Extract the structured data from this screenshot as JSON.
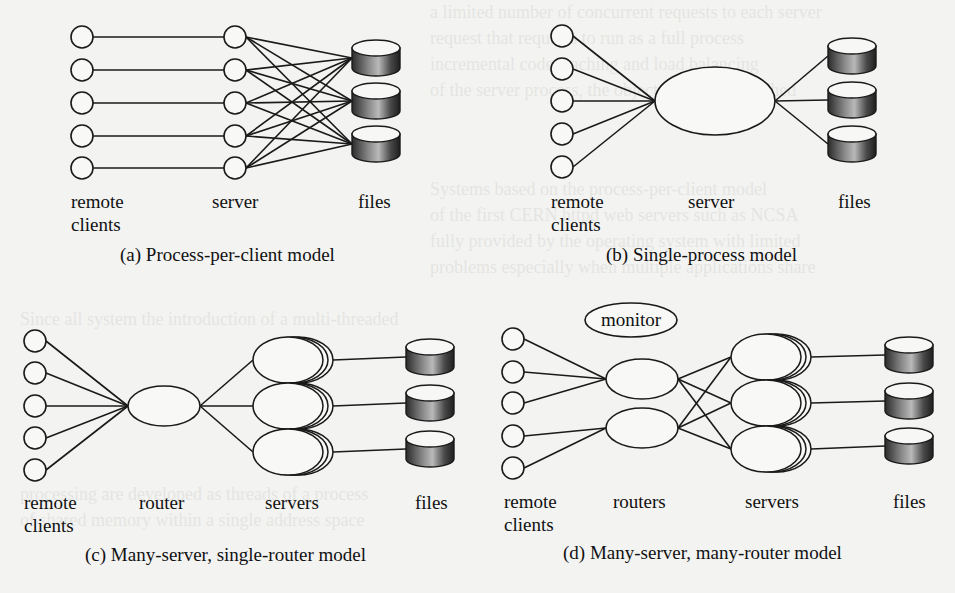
{
  "figure": {
    "panels": [
      {
        "id": "a",
        "caption": "(a) Process-per-client model",
        "labels": {
          "clients_line1": "remote",
          "clients_line2": "clients",
          "server": "server",
          "files": "files"
        },
        "clients": [
          {
            "x": 82,
            "y": 37
          },
          {
            "x": 82,
            "y": 70
          },
          {
            "x": 82,
            "y": 103
          },
          {
            "x": 82,
            "y": 136
          },
          {
            "x": 82,
            "y": 168
          }
        ],
        "servers": [
          {
            "x": 235,
            "y": 37
          },
          {
            "x": 235,
            "y": 70
          },
          {
            "x": 235,
            "y": 103
          },
          {
            "x": 235,
            "y": 136
          },
          {
            "x": 235,
            "y": 168
          }
        ],
        "files": [
          {
            "x": 352,
            "y": 40
          },
          {
            "x": 352,
            "y": 83
          },
          {
            "x": 352,
            "y": 126
          }
        ]
      },
      {
        "id": "b",
        "caption": "(b) Single-process model",
        "labels": {
          "clients_line1": "remote",
          "clients_line2": "clients",
          "server": "server",
          "files": "files"
        },
        "clients": [
          {
            "x": 562,
            "y": 36
          },
          {
            "x": 562,
            "y": 69
          },
          {
            "x": 562,
            "y": 101
          },
          {
            "x": 562,
            "y": 134
          },
          {
            "x": 562,
            "y": 167
          }
        ],
        "server": {
          "cx": 715,
          "cy": 101,
          "rx": 60,
          "ry": 34
        },
        "files": [
          {
            "x": 828,
            "y": 38
          },
          {
            "x": 828,
            "y": 82
          },
          {
            "x": 828,
            "y": 126
          }
        ]
      },
      {
        "id": "c",
        "caption": "(c) Many-server, single-router model",
        "labels": {
          "clients_line1": "remote",
          "clients_line2": "clients",
          "router": "router",
          "servers": "servers",
          "files": "files"
        },
        "clients": [
          {
            "x": 35,
            "y": 341
          },
          {
            "x": 35,
            "y": 373
          },
          {
            "x": 35,
            "y": 406
          },
          {
            "x": 35,
            "y": 438
          },
          {
            "x": 35,
            "y": 470
          }
        ],
        "router": {
          "cx": 164,
          "cy": 406,
          "rx": 36,
          "ry": 20
        },
        "servers": [
          {
            "cx": 288,
            "cy": 360
          },
          {
            "cx": 288,
            "cy": 406
          },
          {
            "cx": 288,
            "cy": 452
          }
        ],
        "files": [
          {
            "x": 406,
            "y": 339
          },
          {
            "x": 406,
            "y": 385
          },
          {
            "x": 406,
            "y": 431
          }
        ]
      },
      {
        "id": "d",
        "caption": "(d) Many-server, many-router model",
        "labels": {
          "clients_line1": "remote",
          "clients_line2": "clients",
          "routers": "routers",
          "servers": "servers",
          "files": "files",
          "monitor": "monitor"
        },
        "clients": [
          {
            "x": 513,
            "y": 339
          },
          {
            "x": 513,
            "y": 372
          },
          {
            "x": 513,
            "y": 403
          },
          {
            "x": 513,
            "y": 436
          },
          {
            "x": 513,
            "y": 468
          }
        ],
        "routers": [
          {
            "cx": 642,
            "cy": 379,
            "rx": 36,
            "ry": 20
          },
          {
            "cx": 642,
            "cy": 428,
            "rx": 36,
            "ry": 20
          }
        ],
        "servers": [
          {
            "cx": 766,
            "cy": 357
          },
          {
            "cx": 766,
            "cy": 403
          },
          {
            "cx": 766,
            "cy": 449
          }
        ],
        "files": [
          {
            "x": 885,
            "y": 337
          },
          {
            "x": 885,
            "y": 383
          },
          {
            "x": 885,
            "y": 428
          }
        ],
        "monitor": {
          "cx": 631,
          "cy": 320,
          "rx": 46,
          "ry": 17
        }
      }
    ]
  },
  "colors": {
    "page": "#f3f3f1",
    "ink": "#1a1a1a",
    "cyl_dark": "#2a2a2a",
    "cyl_light": "#bdbdbd"
  }
}
